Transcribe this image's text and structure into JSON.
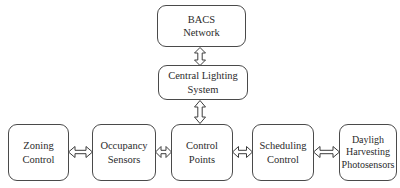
{
  "diagram": {
    "background_color": "#ffffff",
    "line_color": "#3d3d3d",
    "text_color": "#2b2b2b",
    "nodes": [
      {
        "id": "bacs",
        "label": "BACS\nNetwork"
      },
      {
        "id": "central",
        "label": "Central Lighting\nSystem"
      },
      {
        "id": "zoning",
        "label": "Zoning\nControl"
      },
      {
        "id": "occupancy",
        "label": "Occupancy\nSensors"
      },
      {
        "id": "control_pts",
        "label": "Control\nPoints"
      },
      {
        "id": "scheduling",
        "label": "Scheduling\nControl"
      },
      {
        "id": "daylight",
        "label": "Dayligh\nHarvesting\nPhotosensors"
      }
    ],
    "connectors": [
      {
        "id": "bacs_central",
        "icon": "double-arrow-vertical-icon"
      },
      {
        "id": "central_cp",
        "icon": "double-arrow-vertical-icon"
      },
      {
        "id": "zoning_occ",
        "icon": "double-arrow-horizontal-icon"
      },
      {
        "id": "occ_cp",
        "icon": "double-arrow-horizontal-icon"
      },
      {
        "id": "cp_sched",
        "icon": "double-arrow-horizontal-icon"
      },
      {
        "id": "sched_daylight",
        "icon": "double-arrow-horizontal-icon"
      }
    ]
  }
}
